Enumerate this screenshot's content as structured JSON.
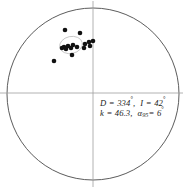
{
  "figure": {
    "type": "equal-area-stereonet",
    "title": "",
    "background_color": "#ffffff",
    "outline_color": "#4a4a4a",
    "crosshair_color": "#9a9a9a",
    "point_color": "#111111",
    "ellipse_color": "#b9b9b9"
  },
  "net": {
    "center_x": 93,
    "center_y": 94,
    "radius": 86,
    "vertical_axis_label": "",
    "horizontal_axis_label": ""
  },
  "statistics": {
    "declination_symbol": "D",
    "declination_value": "334",
    "inclination_symbol": "I",
    "inclination_value": "42",
    "kappa_symbol": "k",
    "kappa_value": "46.3",
    "alpha_symbol": "α",
    "alpha_subscript": "95",
    "alpha_value": "6",
    "degree_sign": "°",
    "equals": "=",
    "comma": ",",
    "line_1_full": "D = 334°,  I = 42°",
    "line_2_full": "k = 46.3,  α95 = 6°"
  },
  "chart_data": {
    "type": "scatter",
    "title": "",
    "xlabel": "",
    "ylabel": "",
    "projection": "equal-area lower hemisphere stereonet",
    "xlim": [
      -1,
      1
    ],
    "ylim": [
      -1,
      1
    ],
    "grid": false,
    "legend_position": "none",
    "annotations": [
      "D = 334°,  I = 42°",
      "k = 46.3,  α95 = 6°"
    ],
    "mean_direction": {
      "declination": 334,
      "inclination": 42,
      "k": 46.3,
      "a95": 6
    },
    "confidence_ellipse": {
      "center_px": [
        71,
        45
      ],
      "radius_x_px": 11.5,
      "radius_y_px": 8.5,
      "rotation_deg": -12
    },
    "series": [
      {
        "name": "site mean directions",
        "marker": "filled-circle",
        "marker_size_px": 4.6,
        "color": "#111111",
        "points_px": [
          [
            65,
            30
          ],
          [
            80,
            33
          ],
          [
            89,
            42
          ],
          [
            93,
            41
          ],
          [
            85,
            44
          ],
          [
            73,
            45
          ],
          [
            68,
            46
          ],
          [
            64,
            47
          ],
          [
            62,
            48
          ],
          [
            66,
            49
          ],
          [
            71,
            48
          ],
          [
            77,
            47
          ],
          [
            84,
            48
          ],
          [
            90,
            46
          ],
          [
            72,
            55
          ],
          [
            54,
            61
          ]
        ]
      }
    ]
  }
}
